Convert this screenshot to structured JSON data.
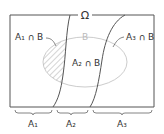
{
  "diagram": {
    "universe_label": "Ω",
    "set_b_label": "B",
    "regions": [
      {
        "id": "a1-cap-b",
        "label": "A₁ ∩ B",
        "hatched": true
      },
      {
        "id": "a2-cap-b",
        "label": "A₂ ∩ B",
        "hatched": false
      },
      {
        "id": "a3-cap-b",
        "label": "A₃ ∩ B",
        "hatched": false
      }
    ],
    "partitions": [
      {
        "id": "a1",
        "label": "A₁"
      },
      {
        "id": "a2",
        "label": "A₂"
      },
      {
        "id": "a3",
        "label": "A₃"
      }
    ],
    "colors": {
      "outline": "#555555",
      "ellipse": "#cccccc",
      "b_label": "#bbbbbb",
      "hatch": "#aaaaaa",
      "text": "#333333"
    }
  }
}
